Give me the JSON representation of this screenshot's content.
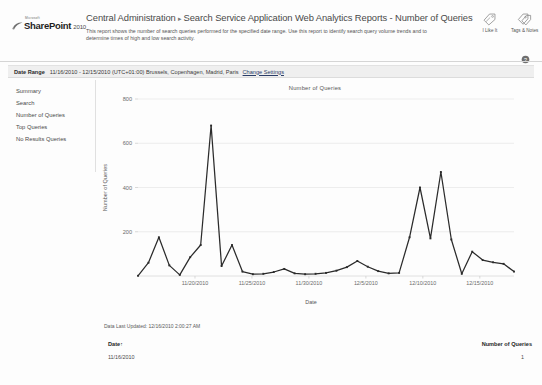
{
  "branding": {
    "microsoft": "Microsoft",
    "product": "SharePoint",
    "year": "2010",
    "swoosh_icon": "sharepoint-swoosh-icon"
  },
  "header": {
    "breadcrumb_root": "Central Administration",
    "breadcrumb_separator": "▸",
    "breadcrumb_current": "Search Service Application Web Analytics Reports - Number of Queries",
    "description": "This report shows the number of search queries performed for the specified date range. Use this report to identify search query volume trends and to determine times of high and low search activity.",
    "social": [
      {
        "label": "I Like It",
        "icon": "tag-like-icon"
      },
      {
        "label": "Tags & Notes",
        "icon": "tags-notes-icon"
      }
    ],
    "help_icon": "help-question-icon"
  },
  "date_range": {
    "label": "Date Range",
    "value": "11/16/2010 - 12/15/2010 (UTC+01:00) Brussels, Copenhagen, Madrid, Paris",
    "change_link": "Change Settings"
  },
  "sidebar": {
    "items": [
      {
        "label": "Summary"
      },
      {
        "label": "Search"
      },
      {
        "label": "Number of Queries"
      },
      {
        "label": "Top Queries"
      },
      {
        "label": "No Results Queries"
      }
    ]
  },
  "footer": {
    "last_updated": "Data Last Updated: 12/16/2010 2:00:27 AM"
  },
  "table": {
    "columns": [
      {
        "label": "Date",
        "sort_indicator": "↑"
      },
      {
        "label": "Number of Queries",
        "sort_indicator": ""
      }
    ],
    "rows": [
      {
        "date": "11/16/2010",
        "queries": "1"
      }
    ]
  },
  "chart_data": {
    "type": "line",
    "title": "Number of Queries",
    "xlabel": "Date",
    "ylabel": "Number of Queries",
    "ylim": [
      0,
      800
    ],
    "yticks": [
      200,
      400,
      600,
      800
    ],
    "grid": true,
    "legend": "none",
    "marker": "square",
    "line_color": "#2b2b2b",
    "xticks": [
      "11/20/2010",
      "11/25/2010",
      "11/30/2010",
      "12/5/2010",
      "12/10/2010",
      "12/15/2010"
    ],
    "x": [
      "11/16/2010",
      "11/17/2010",
      "11/18/2010",
      "11/19/2010",
      "11/20/2010",
      "11/21/2010",
      "11/22/2010",
      "11/23/2010",
      "11/24/2010",
      "11/25/2010",
      "11/26/2010",
      "11/27/2010",
      "11/28/2010",
      "11/29/2010",
      "11/30/2010",
      "12/1/2010",
      "12/2/2010",
      "12/3/2010",
      "12/4/2010",
      "12/5/2010",
      "12/6/2010",
      "12/7/2010",
      "12/8/2010",
      "12/9/2010",
      "12/10/2010",
      "12/11/2010",
      "12/12/2010",
      "12/13/2010",
      "12/14/2010",
      "12/15/2010"
    ],
    "values": [
      1,
      60,
      175,
      48,
      5,
      85,
      140,
      680,
      45,
      140,
      20,
      8,
      10,
      18,
      32,
      12,
      8,
      10,
      14,
      24,
      40,
      68,
      42,
      22,
      12,
      14,
      175,
      400,
      170,
      470
    ],
    "series_values_detail": [
      1,
      60,
      175,
      48,
      5,
      85,
      140,
      680,
      45,
      140,
      20,
      8,
      10,
      18,
      32,
      12,
      8,
      10,
      14,
      24,
      40,
      68,
      42,
      22,
      12,
      14,
      175,
      400,
      170,
      470,
      165,
      10,
      110,
      72,
      62,
      55,
      20
    ]
  }
}
